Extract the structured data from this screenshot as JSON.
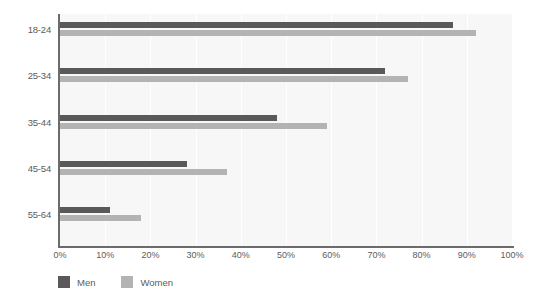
{
  "chart_data": {
    "type": "bar",
    "orientation": "horizontal",
    "title": "",
    "subtitle": "",
    "xlabel": "",
    "ylabel": "",
    "categories": [
      "18-24",
      "25-34",
      "35-44",
      "45-54",
      "55-64"
    ],
    "series": [
      {
        "name": "Men",
        "color": "#595959",
        "values": [
          87,
          72,
          48,
          28,
          11
        ]
      },
      {
        "name": "Women",
        "color": "#b3b3b3",
        "values": [
          92,
          77,
          59,
          37,
          18
        ]
      }
    ],
    "xlim": [
      0,
      100
    ],
    "xticks": [
      0,
      10,
      20,
      30,
      40,
      50,
      60,
      70,
      80,
      90,
      100
    ],
    "xtick_labels": [
      "0%",
      "10%",
      "20%",
      "30%",
      "40%",
      "50%",
      "60%",
      "70%",
      "80%",
      "90%",
      "100%"
    ],
    "value_suffix": "%",
    "grid": true,
    "grid_axis": "x",
    "legend": [
      "Men",
      "Women"
    ],
    "legend_position": "bottom-left"
  },
  "colors": {
    "men": "#595959",
    "women": "#b3b3b3",
    "plot_background": "#f7f7f7",
    "gridline": "#ffffff",
    "axis": "#6b6b6b",
    "text": "#5c5c5c",
    "page_background": "#ffffff"
  },
  "legend": {
    "items": [
      {
        "label": "Men",
        "swatch": "men-swatch"
      },
      {
        "label": "Women",
        "swatch": "women-swatch"
      }
    ]
  }
}
